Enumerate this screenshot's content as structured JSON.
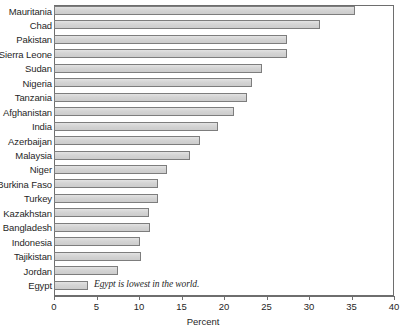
{
  "chart_data": {
    "type": "bar",
    "orientation": "horizontal",
    "title": "",
    "xlabel": "Percent",
    "ylabel": "",
    "xlim": [
      0,
      40
    ],
    "xticks": [
      0,
      5,
      10,
      15,
      20,
      25,
      30,
      35,
      40
    ],
    "xtick_labels": [
      "0",
      "5",
      "10",
      "15",
      "20",
      "25",
      "30",
      "35",
      "40"
    ],
    "grid": false,
    "legend": false,
    "bar_fill_color": "#d6d6d6",
    "bar_border_color": "#7d7d7d",
    "categories": [
      "Mauritania",
      "Chad",
      "Pakistan",
      "Sierra Leone",
      "Sudan",
      "Nigeria",
      "Tanzania",
      "Afghanistan",
      "India",
      "Azerbaijan",
      "Malaysia",
      "Niger",
      "Burkina Faso",
      "Turkey",
      "Kazakhstan",
      "Bangladesh",
      "Indonesia",
      "Tajikistan",
      "Jordan",
      "Egypt"
    ],
    "values": [
      35.4,
      31.3,
      27.4,
      27.4,
      24.5,
      23.3,
      22.7,
      21.2,
      19.3,
      17.2,
      16.0,
      13.3,
      12.2,
      12.2,
      11.2,
      11.3,
      10.1,
      10.2,
      7.5,
      4.0
    ],
    "annotations": [
      {
        "text": "Egypt is lowest in the world.",
        "attached_to": "Egypt",
        "style": "italic"
      }
    ]
  }
}
